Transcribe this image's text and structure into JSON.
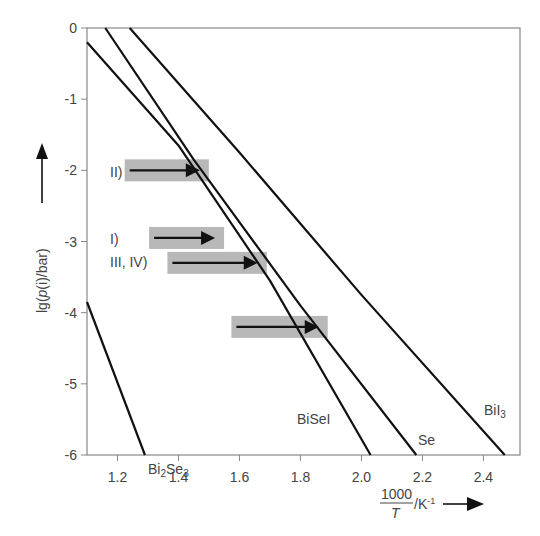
{
  "chart_data": {
    "type": "line",
    "title": "",
    "xlabel": "1000/T / K^-1",
    "xlabel_parts": {
      "numerator": "1000",
      "denominator": "T",
      "unit": "/K",
      "exponent": "-1"
    },
    "ylabel": "lg(p(i)/bar)",
    "ylabel_parts": {
      "prefix": "lg(",
      "var": "p",
      "arg": "(i)",
      "suffix": "/bar)"
    },
    "xlim": [
      1.1,
      2.52
    ],
    "ylim": [
      -6,
      0
    ],
    "x_ticks": [
      "1.2",
      "1.4",
      "1.6",
      "1.8",
      "2.0",
      "2.2",
      "2.4"
    ],
    "y_ticks": [
      "0",
      "-1",
      "-2",
      "-3",
      "-4",
      "-5",
      "-6"
    ],
    "grid": false,
    "legend": "inline curve labels",
    "series": [
      {
        "name": "Bi2Se3",
        "label_main": "Bi",
        "label_sub1": "2",
        "label_mid": "Se",
        "label_sub2": "3",
        "x": [
          1.1,
          1.29
        ],
        "y": [
          -3.85,
          -6.0
        ]
      },
      {
        "name": "BiSeI",
        "label": "BiSeI",
        "x": [
          1.1,
          1.4,
          1.7,
          2.03
        ],
        "y": [
          -0.2,
          -1.65,
          -3.55,
          -6.0
        ]
      },
      {
        "name": "Se",
        "label": "Se",
        "x": [
          1.16,
          1.45,
          1.8,
          2.18
        ],
        "y": [
          0.0,
          -1.85,
          -3.9,
          -6.0
        ]
      },
      {
        "name": "BiI3",
        "label_main": "BiI",
        "label_sub": "3",
        "x": [
          1.24,
          1.6,
          2.0,
          2.47
        ],
        "y": [
          0.0,
          -1.75,
          -3.75,
          -6.0
        ]
      }
    ],
    "annotations": [
      {
        "label": "II)",
        "arrow_from_x": 1.24,
        "arrow_to_x": 1.47,
        "y": -2.0
      },
      {
        "label": "I)",
        "arrow_from_x": 1.32,
        "arrow_to_x": 1.52,
        "y": -2.95
      },
      {
        "label": "III, IV)",
        "arrow_from_x": 1.38,
        "arrow_to_x": 1.66,
        "y": -3.3
      },
      {
        "label": "",
        "arrow_from_x": 1.59,
        "arrow_to_x": 1.86,
        "y": -4.2
      }
    ]
  },
  "colors": {
    "line": "#111111",
    "axis": "#777777",
    "arrow_box": "#b8b8b8",
    "text": "#444444"
  }
}
